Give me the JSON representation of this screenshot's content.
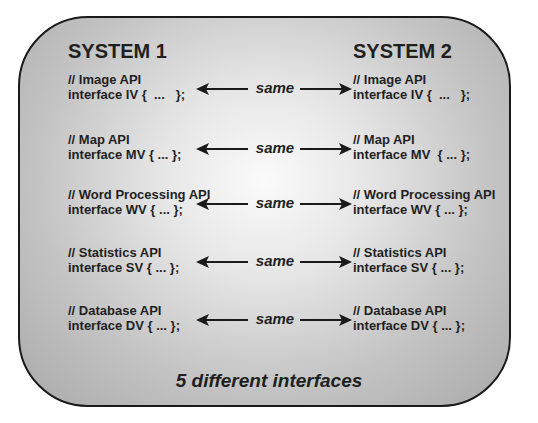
{
  "systems": {
    "left_title": "SYSTEM 1",
    "right_title": "SYSTEM 2"
  },
  "relation_label": "same",
  "interfaces": [
    {
      "comment": "// Image API",
      "left_code": "interface IV {  ...   };",
      "right_code": "interface IV {  ...   };"
    },
    {
      "comment": "// Map API",
      "left_code": "interface MV { ... };",
      "right_code": "interface MV  { ... };"
    },
    {
      "comment": "// Word Processing API",
      "left_code": "interface WV { ... };",
      "right_code": "interface WV { ... };"
    },
    {
      "comment": "// Statistics API",
      "left_code": "interface SV { ... };",
      "right_code": "interface SV { ... };"
    },
    {
      "comment": "// Database API",
      "left_code": "interface DV { ... };",
      "right_code": "interface DV { ... };"
    }
  ],
  "footer": "5 different interfaces",
  "colors": {
    "text": "#1f1f1f",
    "border": "#1a1a1a"
  }
}
